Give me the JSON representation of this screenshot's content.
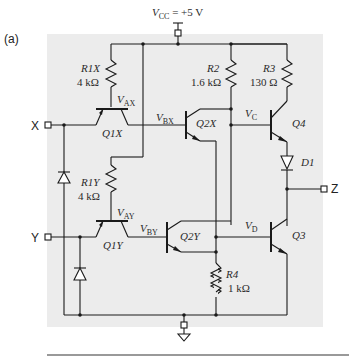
{
  "figure": {
    "panel_label": "(a)",
    "background_color": "#ececec"
  },
  "supply": {
    "vcc_symbol": "V",
    "vcc_sub": "CC",
    "vcc_value": " = +5 V"
  },
  "terminals": {
    "input_x": "X",
    "input_y": "Y",
    "output_z": "Z"
  },
  "resistors": [
    {
      "name": "R1X",
      "value": "4 kΩ"
    },
    {
      "name": "R1Y",
      "value": "4 kΩ"
    },
    {
      "name": "R2",
      "value": "1.6 kΩ"
    },
    {
      "name": "R3",
      "value": "130 Ω"
    },
    {
      "name": "R4",
      "value": "1 kΩ"
    }
  ],
  "transistors": [
    "Q1X",
    "Q1Y",
    "Q2X",
    "Q2Y",
    "Q3",
    "Q4"
  ],
  "diodes": [
    "D1"
  ],
  "nodes": [
    {
      "symbol": "V",
      "sub": "AX"
    },
    {
      "symbol": "V",
      "sub": "AY"
    },
    {
      "symbol": "V",
      "sub": "BX"
    },
    {
      "symbol": "V",
      "sub": "BY"
    },
    {
      "symbol": "V",
      "sub": "C"
    },
    {
      "symbol": "V",
      "sub": "D"
    }
  ]
}
